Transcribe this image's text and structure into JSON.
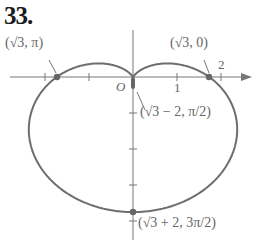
{
  "problem_number": "33.",
  "axes": {
    "origin_label": "O",
    "x_tick_labels": [
      "1",
      "2"
    ]
  },
  "points": [
    {
      "label": "(√3, π)",
      "r": "√3",
      "theta": "π"
    },
    {
      "label": "(√3, 0)",
      "r": "√3",
      "theta": "0"
    },
    {
      "label": "(√3 − 2, π/2)",
      "r": "√3 − 2",
      "theta": "π/2"
    },
    {
      "label": "(√3 + 2, 3π/2)",
      "r": "√3 + 2",
      "theta": "3π/2"
    }
  ],
  "labels": {
    "p1": "(√3, π)",
    "p2": "(√3, 0)",
    "p3_r": "(√3 − 2,",
    "p3_theta": "π/2)",
    "p4_r": "(√3 + 2,",
    "p4_theta": "3π/2)"
  },
  "curve": {
    "type": "limaçon",
    "equation": "r = √3 − 2 sin θ",
    "color": "#6e6e6e"
  }
}
